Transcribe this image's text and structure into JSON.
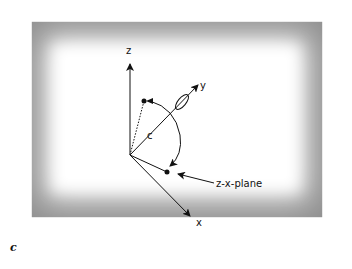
{
  "figure": {
    "caption_letter": "c",
    "axes": {
      "z_label": "z",
      "y_label": "y",
      "x_label": "x"
    },
    "angle_label": "c",
    "annotation": "z-x-plane"
  },
  "colors": {
    "frame_gray": "#8f8f8f",
    "ink": "#111111",
    "background": "#ffffff"
  }
}
